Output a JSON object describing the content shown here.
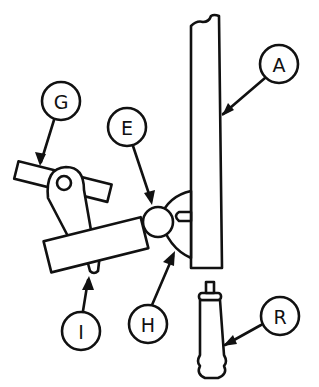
{
  "diagram": {
    "type": "technical-parts-illustration",
    "labels": [
      {
        "id": "A",
        "text": "A",
        "part": "vertical-post"
      },
      {
        "id": "G",
        "text": "G",
        "part": "lever-arm-crossbar"
      },
      {
        "id": "E",
        "text": "E",
        "part": "ball-joint"
      },
      {
        "id": "H",
        "text": "H",
        "part": "pivot-housing"
      },
      {
        "id": "I",
        "text": "I",
        "part": "lever-tip"
      },
      {
        "id": "R",
        "text": "R",
        "part": "handle"
      }
    ],
    "colors": {
      "ink": "#111111",
      "background": "#ffffff"
    }
  }
}
